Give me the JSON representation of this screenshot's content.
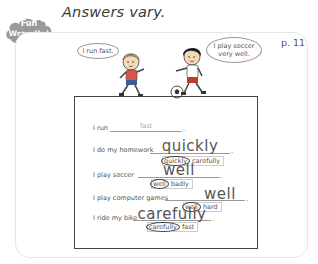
{
  "header": {
    "badge_line1": "Fun",
    "badge_line2": "Wrap-Up!",
    "title": "Answers vary.",
    "page_number": "p. 11"
  },
  "illustration": {
    "bubble_left": "I run fast.",
    "bubble_right_line1": "I play soccer",
    "bubble_right_line2": "very well."
  },
  "worksheet": {
    "rows": [
      {
        "prompt": "I run",
        "answer": "fast",
        "choices": null
      },
      {
        "prompt": "I do my homework",
        "answer": "quickly",
        "choices": {
          "circled": "quickly",
          "other": "carefully"
        }
      },
      {
        "prompt": "I play soccer",
        "answer": "well",
        "choices": {
          "circled": "well",
          "other": "badly"
        }
      },
      {
        "prompt": "I play computer games",
        "answer": "well",
        "choices": {
          "circled": "well",
          "other": "hard"
        }
      },
      {
        "prompt": "I ride my bike",
        "answer": "carefully",
        "choices": {
          "circled": "carefully",
          "other": "fast"
        }
      }
    ],
    "punctuation": "."
  },
  "colors": {
    "badge_fill": "#9a9a9a",
    "text": "#555555",
    "worksheet_border": "#444444",
    "faint_answer": "#aaaaaa"
  }
}
